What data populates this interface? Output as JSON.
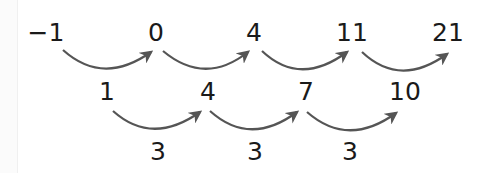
{
  "diagram": {
    "title": "",
    "top_row": {
      "values": [
        "−1",
        "0",
        "4",
        "11",
        "21"
      ]
    },
    "middle_row": {
      "label": "first differences",
      "values": [
        "1",
        "4",
        "7",
        "10"
      ]
    },
    "bottom_row": {
      "label": "second differences",
      "values": [
        "3",
        "3",
        "3"
      ]
    },
    "arrow_color": "#555555"
  }
}
